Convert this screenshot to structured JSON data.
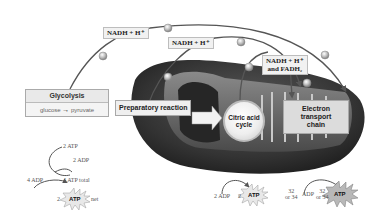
{
  "diagram": {
    "colors": {
      "mitochondrion_outer": "#3a3a3a",
      "mitochondrion_inner": "#6a6a6a",
      "label_box": "#f1f1f1",
      "process_box": "#dcdcdc",
      "arrow": "#555555",
      "background": "#ffffff"
    },
    "carriers": {
      "nadh_top": "NADH + H⁺",
      "nadh_middle": "NADH + H⁺",
      "nadh_fadh2_line1": "NADH + H⁺",
      "nadh_fadh2_line2": "and FADH₂"
    },
    "processes": {
      "glycolysis_title": "Glycolysis",
      "glycolysis_reactant": "glucose",
      "glycolysis_product": "pyruvate",
      "glycolysis_arrow": "→",
      "preparatory": "Preparatory reaction",
      "citric_acid_line1": "Citric acid",
      "citric_acid_line2": "cycle",
      "etc_line1": "Electron transport",
      "etc_line2": "chain"
    },
    "glycolysis_atp": {
      "atp_in": "2 ATP",
      "adp_out": "2 ADP",
      "adp_in": "4 ADP",
      "atp_total": "4 ATP total",
      "net_count": "2",
      "atp_label": "ATP",
      "net_label": "net"
    },
    "citric_atp": {
      "adp": "2 ADP",
      "count": "2",
      "atp_label": "ATP"
    },
    "etc_atp": {
      "count_line1": "32",
      "count_line2": "or 34",
      "adp": "ADP",
      "count2_line1": "32",
      "count2_line2": "or 34",
      "atp_label": "ATP"
    },
    "electron_icon": "e⁻"
  }
}
